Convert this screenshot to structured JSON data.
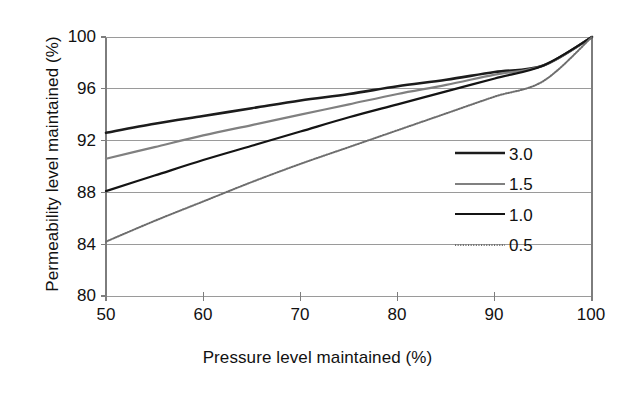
{
  "chart_data": {
    "type": "line",
    "title": "",
    "xlabel": "Pressure level maintained (%)",
    "ylabel": "Permeability level maintained (%)",
    "xlim": [
      50,
      100
    ],
    "ylim": [
      80,
      100
    ],
    "xticks": [
      "50",
      "60",
      "70",
      "80",
      "90",
      "100"
    ],
    "yticks": [
      "100",
      "96",
      "92",
      "88",
      "84",
      "80"
    ],
    "xtick_values": [
      50,
      60,
      70,
      80,
      90,
      100
    ],
    "ytick_values": [
      100,
      96,
      92,
      88,
      84,
      80
    ],
    "grid": "horizontal",
    "legend_position": "right-outside",
    "series": [
      {
        "name": "3.0",
        "color": "#1c1c1c",
        "width": 2.6,
        "dash": "none",
        "x": [
          50,
          55,
          60,
          65,
          70,
          75,
          80,
          85,
          90,
          95,
          100
        ],
        "values": [
          92.6,
          93.3,
          93.9,
          94.5,
          95.1,
          95.6,
          96.2,
          96.7,
          97.3,
          97.8,
          100.0
        ]
      },
      {
        "name": "1.5",
        "color": "#808080",
        "width": 2.2,
        "dash": "none",
        "x": [
          50,
          55,
          60,
          65,
          70,
          75,
          80,
          85,
          90,
          95,
          100
        ],
        "values": [
          90.6,
          91.5,
          92.4,
          93.2,
          94.0,
          94.8,
          95.6,
          96.3,
          97.1,
          97.8,
          100.0
        ]
      },
      {
        "name": "1.0",
        "color": "#141414",
        "width": 2.2,
        "dash": "none",
        "x": [
          50,
          55,
          60,
          65,
          70,
          75,
          80,
          85,
          90,
          95,
          100
        ],
        "values": [
          88.1,
          89.3,
          90.5,
          91.6,
          92.7,
          93.8,
          94.8,
          95.8,
          96.8,
          97.8,
          100.0
        ]
      },
      {
        "name": "0.5",
        "color": "#6e6e6e",
        "width": 2.0,
        "dash": "dotted",
        "x": [
          50,
          55,
          60,
          65,
          70,
          75,
          80,
          85,
          90,
          95,
          100
        ],
        "values": [
          84.2,
          85.8,
          87.3,
          88.8,
          90.2,
          91.5,
          92.8,
          94.1,
          95.4,
          96.6,
          100.0
        ]
      }
    ]
  },
  "legend": {
    "entries": [
      {
        "label": "3.0"
      },
      {
        "label": "1.5"
      },
      {
        "label": "1.0"
      },
      {
        "label": "0.5"
      }
    ]
  },
  "colors": {
    "axis": "#7d7d7d",
    "grid": "#9a9a9a",
    "text": "#111111",
    "background": "#ffffff"
  }
}
